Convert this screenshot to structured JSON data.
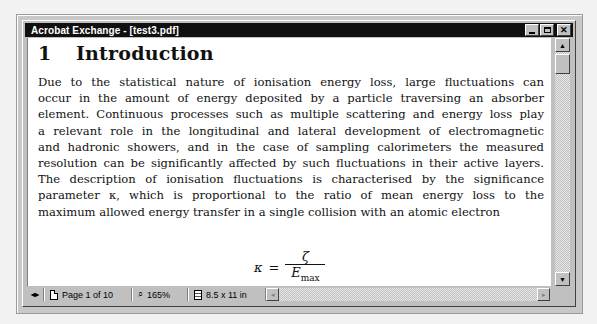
{
  "window": {
    "title": "Acrobat Exchange - [test3.pdf]",
    "buttons": {
      "minimize": "_",
      "maximize": "□",
      "close": "✕"
    }
  },
  "document": {
    "heading_number": "1",
    "heading_title": "Introduction",
    "paragraph_lines": [
      "Due to the statistical nature of ionisation energy loss, large fluctuations can",
      "occur in the amount of energy deposited by a particle traversing an absorber",
      "element. Continuous processes such as multiple scattering and energy loss play",
      "a relevant role in the longitudinal and lateral development of electromagnetic",
      "and hadronic showers, and in the case of sampling calorimeters the measured",
      "resolution can be significantly affected by such fluctuations in their active layers.",
      "The description of ionisation fluctuations is characterised by the significance",
      "parameter κ, which is proportional to the ratio of mean energy loss to the",
      "maximum allowed energy transfer in a single collision with an atomic electron"
    ],
    "formula": {
      "lhs": "κ",
      "equals": "=",
      "numerator": "ζ",
      "denominator_main": "E",
      "denominator_sub": "max"
    }
  },
  "statusbar": {
    "nav_icon": "◂▸",
    "page_label": "Page 1 of 10",
    "zoom_icon": "🔍",
    "zoom_label": "165%",
    "page_size_label": "8.5 x 11 in"
  },
  "scrollbars": {
    "up_arrow": "▲",
    "down_arrow": "▼",
    "left_arrow": "◂",
    "right_arrow": "▸"
  }
}
